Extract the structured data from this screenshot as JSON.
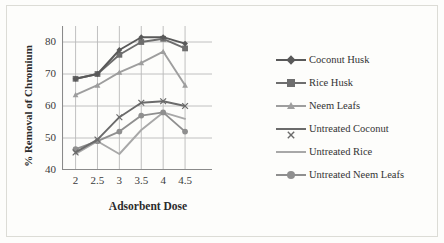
{
  "chart_data": {
    "type": "line",
    "title": "",
    "xlabel": "Adsorbent Dose",
    "ylabel": "% Removal of Chromium",
    "categories": [
      "2",
      "2.5",
      "3",
      "3.5",
      "4",
      "4.5"
    ],
    "x": [
      2,
      2.5,
      3,
      3.5,
      4,
      4.5
    ],
    "ylim": [
      40,
      85
    ],
    "yticks": [
      40,
      50,
      60,
      70,
      80
    ],
    "grid": "horizontal-and-vertical",
    "legend_position": "right",
    "series": [
      {
        "name": "Coconut Husk",
        "marker": "diamond",
        "color": "#595959",
        "values": [
          68.5,
          70.0,
          77.5,
          81.5,
          81.5,
          79.5
        ]
      },
      {
        "name": "Rice Husk",
        "marker": "square",
        "color": "#6e6e6e",
        "values": [
          68.5,
          70.0,
          76.0,
          80.0,
          81.0,
          78.0
        ]
      },
      {
        "name": "Neem Leafs",
        "marker": "triangle",
        "color": "#9e9e9e",
        "values": [
          63.5,
          66.5,
          70.5,
          73.5,
          77.0,
          66.5
        ]
      },
      {
        "name": "Untreated Coconut",
        "marker": "cross",
        "color": "#6b6b6b",
        "values": [
          45.5,
          49.5,
          56.5,
          61.0,
          61.5,
          60.0
        ]
      },
      {
        "name": "Untreated Rice",
        "marker": "none",
        "color": "#a8a8a8",
        "values": [
          45.0,
          49.0,
          45.0,
          52.5,
          58.0,
          56.0
        ]
      },
      {
        "name": "Untreated Neem Leafs",
        "marker": "circle",
        "color": "#8f8f8f",
        "values": [
          46.5,
          49.0,
          52.0,
          57.0,
          58.0,
          52.0
        ]
      }
    ]
  },
  "axis": {
    "y_title": "% Removal of Chromium",
    "x_title": "Adsorbent Dose",
    "y_tick_labels": [
      "80",
      "70",
      "60",
      "50",
      "40"
    ],
    "x_tick_labels": [
      "2",
      "2.5",
      "3",
      "3.5",
      "4",
      "4.5"
    ]
  },
  "legend": {
    "items": [
      {
        "label": "Coconut Husk"
      },
      {
        "label": "Rice Husk"
      },
      {
        "label": "Neem Leafs"
      },
      {
        "label": "Untreated Coconut"
      },
      {
        "label": "Untreated Rice"
      },
      {
        "label": "Untreated Neem Leafs"
      }
    ]
  },
  "colors": {
    "background": "#fdfdfb",
    "frame": "#dcdcd6",
    "grid": "#b9b9b9",
    "text": "#333333"
  }
}
